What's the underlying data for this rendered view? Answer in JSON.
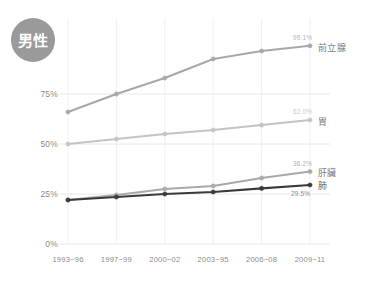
{
  "badge": {
    "label": "男性",
    "color": "#9a9a9a",
    "text_color": "#ffffff"
  },
  "axes": {
    "y_ticks": [
      "75%",
      "50%",
      "25%",
      "0%"
    ],
    "y_tick_values": [
      75,
      50,
      25,
      0
    ],
    "x_ticks": [
      "1993~96",
      "1997~99",
      "2000~02",
      "2003~95",
      "2006~08",
      "2009~11"
    ],
    "tick_color": "#8c8c8c",
    "grid": true,
    "grid_color": "#e8e8e8"
  },
  "chart_data": {
    "type": "line",
    "title": "男性",
    "xlabel": "",
    "ylabel": "",
    "ylim": [
      0,
      105
    ],
    "categories": [
      "1993~96",
      "1997~99",
      "2000~02",
      "2003~95",
      "2006~08",
      "2009~11"
    ],
    "grid": true,
    "legend": "inline-right",
    "series": [
      {
        "name": "前立腺",
        "color": "#a8a8a8",
        "values": [
          66.0,
          75.0,
          83.0,
          92.5,
          96.5,
          99.1
        ],
        "end_label": "99.1%",
        "end_label_color": "#b4b4b4"
      },
      {
        "name": "胃",
        "color": "#c4c4c4",
        "values": [
          50.0,
          52.5,
          55.0,
          57.0,
          59.5,
          62.0
        ],
        "end_label": "62.0%",
        "end_label_color": "#c9c9c9"
      },
      {
        "name": "肝臟",
        "color": "#a9a9a9",
        "values": [
          22.0,
          24.5,
          27.5,
          29.0,
          33.0,
          36.2
        ],
        "end_label": "36.2%",
        "end_label_color": "#b0b0b0"
      },
      {
        "name": "肺",
        "color": "#3a3a3a",
        "values": [
          22.0,
          23.5,
          25.0,
          26.0,
          27.8,
          29.5
        ],
        "end_label": "29.5%",
        "end_label_color": "#8c8c8c"
      }
    ]
  }
}
